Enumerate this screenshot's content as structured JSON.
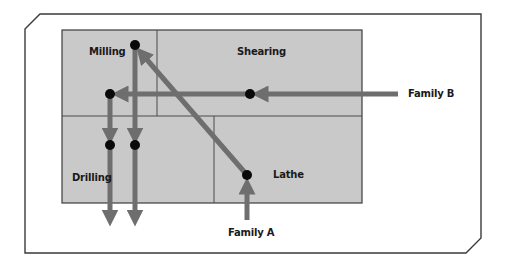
{
  "diagram": {
    "type": "process-layout-flow",
    "colors": {
      "frame": "#3a3a3a",
      "cell_fill": "#c9c9c9",
      "cell_border": "#3c3c3c",
      "arrow": "#6e6e6e",
      "node": "#0a0a0a",
      "text": "#1a1a1a"
    },
    "departments": [
      {
        "id": "milling",
        "label": "Milling"
      },
      {
        "id": "shearing",
        "label": "Shearing"
      },
      {
        "id": "drilling",
        "label": "Drilling"
      },
      {
        "id": "lathe",
        "label": "Lathe"
      }
    ],
    "flows": [
      {
        "id": "family-a",
        "label": "Family A",
        "path": [
          "entry",
          "Lathe",
          "Milling",
          "Drilling",
          "exit"
        ]
      },
      {
        "id": "family-b",
        "label": "Family B",
        "path": [
          "entry",
          "Shearing",
          "Milling",
          "Drilling",
          "exit"
        ]
      }
    ]
  }
}
